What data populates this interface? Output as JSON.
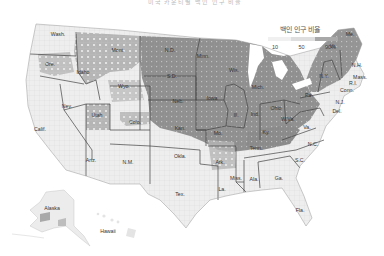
{
  "title": "미국 카운티별 백인 인구 비율",
  "legend": {
    "title": "백인 인구 비율",
    "ticks": [
      "10",
      "50",
      "90%"
    ],
    "colors": [
      "#f2f2f2",
      "#dcdcdc",
      "#a9a9a9"
    ]
  },
  "colors": {
    "low": "#ececec",
    "mid": "#c8c8c8",
    "high": "#8f8f8f",
    "veryhigh": "#7a7a7a",
    "border": "#444444",
    "county_line": "#d4d4d4"
  },
  "state_labels": [
    {
      "abbr": "Wash.",
      "x": 58,
      "y": 36
    },
    {
      "abbr": "Ore.",
      "x": 50,
      "y": 66
    },
    {
      "abbr": "Idaho",
      "x": 83,
      "y": 74
    },
    {
      "abbr": "Mont.",
      "x": 118,
      "y": 52
    },
    {
      "abbr": "Wyo.",
      "x": 124,
      "y": 88
    },
    {
      "abbr": "Nev.",
      "x": 67,
      "y": 108
    },
    {
      "abbr": "Calif.",
      "x": 40,
      "y": 131
    },
    {
      "abbr": "Utah",
      "x": 97,
      "y": 117
    },
    {
      "abbr": "Colo.",
      "x": 135,
      "y": 124
    },
    {
      "abbr": "Ariz.",
      "x": 91,
      "y": 162
    },
    {
      "abbr": "N.M.",
      "x": 128,
      "y": 164
    },
    {
      "abbr": "N.D.",
      "x": 170,
      "y": 52
    },
    {
      "abbr": "S.D.",
      "x": 172,
      "y": 78
    },
    {
      "abbr": "Neb.",
      "x": 178,
      "y": 103
    },
    {
      "abbr": "Kan.",
      "x": 180,
      "y": 130
    },
    {
      "abbr": "Okla.",
      "x": 180,
      "y": 158
    },
    {
      "abbr": "Tex.",
      "x": 180,
      "y": 196
    },
    {
      "abbr": "Minn.",
      "x": 203,
      "y": 58
    },
    {
      "abbr": "Iowa",
      "x": 212,
      "y": 100
    },
    {
      "abbr": "Mo.",
      "x": 218,
      "y": 135
    },
    {
      "abbr": "Ark.",
      "x": 220,
      "y": 164
    },
    {
      "abbr": "La.",
      "x": 222,
      "y": 191
    },
    {
      "abbr": "Wis.",
      "x": 234,
      "y": 72
    },
    {
      "abbr": "Ill.",
      "x": 236,
      "y": 117
    },
    {
      "abbr": "Mich.",
      "x": 258,
      "y": 89
    },
    {
      "abbr": "Ind.",
      "x": 255,
      "y": 116
    },
    {
      "abbr": "Ohio",
      "x": 276,
      "y": 110
    },
    {
      "abbr": "Ky.",
      "x": 266,
      "y": 134
    },
    {
      "abbr": "Tenn.",
      "x": 256,
      "y": 150
    },
    {
      "abbr": "Miss.",
      "x": 236,
      "y": 180
    },
    {
      "abbr": "Ala.",
      "x": 254,
      "y": 181
    },
    {
      "abbr": "Ga.",
      "x": 279,
      "y": 180
    },
    {
      "abbr": "Fla.",
      "x": 300,
      "y": 212
    },
    {
      "abbr": "S.C.",
      "x": 300,
      "y": 162
    },
    {
      "abbr": "N.C.",
      "x": 313,
      "y": 146
    },
    {
      "abbr": "Va.",
      "x": 307,
      "y": 129
    },
    {
      "abbr": "W.Va.",
      "x": 288,
      "y": 121
    },
    {
      "abbr": "Pa.",
      "x": 309,
      "y": 97
    },
    {
      "abbr": "N.Y.",
      "x": 324,
      "y": 78
    },
    {
      "abbr": "Vt.",
      "x": 333,
      "y": 48
    },
    {
      "abbr": "Me.",
      "x": 350,
      "y": 36
    },
    {
      "abbr": "N.H.",
      "x": 357,
      "y": 67
    },
    {
      "abbr": "Mass.",
      "x": 360,
      "y": 79
    },
    {
      "abbr": "R.I.",
      "x": 353,
      "y": 85
    },
    {
      "abbr": "Conn.",
      "x": 347,
      "y": 92
    },
    {
      "abbr": "N.J.",
      "x": 340,
      "y": 104
    },
    {
      "abbr": "Del.",
      "x": 337,
      "y": 113
    },
    {
      "abbr": "Alaska",
      "x": 52,
      "y": 210
    },
    {
      "abbr": "Hawaii",
      "x": 108,
      "y": 233
    }
  ]
}
